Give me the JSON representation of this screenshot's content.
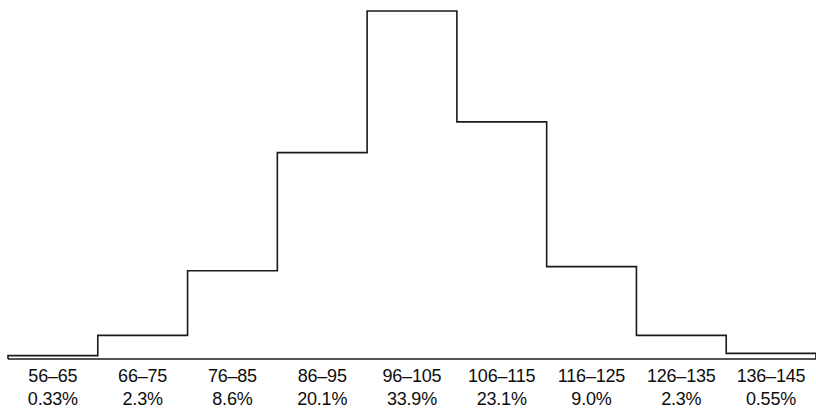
{
  "figure": {
    "width": 816,
    "height": 417,
    "background_color": "#ffffff",
    "stroke_color": "#1a1a1a",
    "text_color": "#0d0d0d"
  },
  "chart_data": {
    "type": "bar",
    "chart_subtype": "histogram",
    "title": "",
    "subtitle": "",
    "xlabel": "",
    "ylabel": "",
    "grid": false,
    "legend": null,
    "axis_visible": {
      "x_baseline": true,
      "y_axis": false,
      "x_ticks": false,
      "y_ticks": false
    },
    "categories": [
      "56–65",
      "66–75",
      "76–85",
      "86–95",
      "96–105",
      "106–115",
      "116–125",
      "126–135",
      "136–145"
    ],
    "value_labels": [
      "0.33%",
      "2.3%",
      "8.6%",
      "20.1%",
      "33.9%",
      "23.1%",
      "9.0%",
      "2.3%",
      "0.55%"
    ],
    "values": [
      0.33,
      2.3,
      8.6,
      20.1,
      33.9,
      23.1,
      9.0,
      2.3,
      0.55
    ],
    "value_unit": "percent",
    "ylim": [
      0,
      33.9
    ],
    "bin_edges": [
      56,
      66,
      76,
      86,
      96,
      106,
      116,
      126,
      136,
      146
    ]
  },
  "labels": {
    "range_row_name": "bin-range-labels",
    "percent_row_name": "bin-percent-labels"
  }
}
